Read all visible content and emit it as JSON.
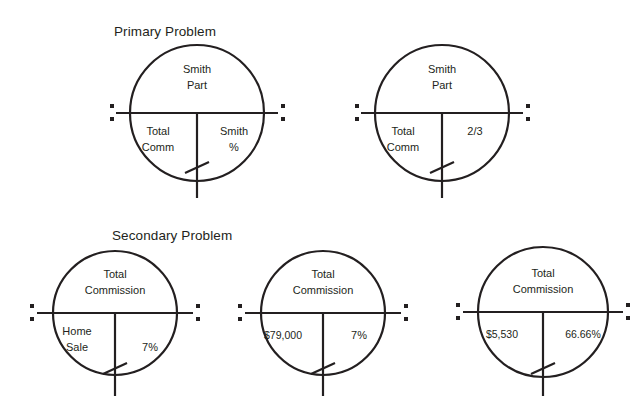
{
  "page": {
    "background": "#ffffff",
    "ink": "#231f20",
    "width": 641,
    "height": 400
  },
  "sections": [
    {
      "id": "primary",
      "title": "Primary Problem",
      "diagrams": [
        {
          "id": "primary-1",
          "top_label": "Smith Part",
          "top_label_lines": [
            "Smith",
            "Part"
          ],
          "bottom_left_label": "Total Comm",
          "bottom_left_lines": [
            "Total",
            "Comm"
          ],
          "bottom_right_label": "Smith %",
          "bottom_right_lines": [
            "Smith",
            "%"
          ]
        },
        {
          "id": "primary-2",
          "top_label": "Smith Part",
          "top_label_lines": [
            "Smith",
            "Part"
          ],
          "bottom_left_label": "Total Comm",
          "bottom_left_lines": [
            "Total",
            "Comm"
          ],
          "bottom_right_label": "2/3",
          "bottom_right_lines": [
            "2/3",
            ""
          ]
        }
      ]
    },
    {
      "id": "secondary",
      "title": "Secondary Problem",
      "diagrams": [
        {
          "id": "secondary-1",
          "top_label": "Total Commission",
          "top_label_lines": [
            "Total",
            "Commission"
          ],
          "bottom_left_label": "Home Sale",
          "bottom_left_lines": [
            "Home",
            "Sale"
          ],
          "bottom_right_label": "7%",
          "bottom_right_lines": [
            "7%",
            ""
          ]
        },
        {
          "id": "secondary-2",
          "top_label": "Total Commission",
          "top_label_lines": [
            "Total",
            "Commission"
          ],
          "bottom_left_label": "$79,000",
          "bottom_left_lines": [
            "$79,000",
            ""
          ],
          "bottom_right_label": "7%",
          "bottom_right_lines": [
            "7%",
            ""
          ]
        },
        {
          "id": "secondary-3",
          "top_label": "Total Commission",
          "top_label_lines": [
            "Total",
            "Commission"
          ],
          "bottom_left_label": "$5,530",
          "bottom_left_lines": [
            "$5,530",
            ""
          ],
          "bottom_right_label": "66.66%",
          "bottom_right_lines": [
            "66.66%",
            ""
          ]
        }
      ]
    }
  ]
}
